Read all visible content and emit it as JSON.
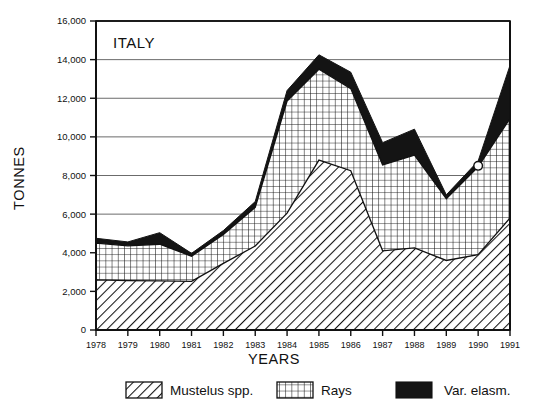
{
  "chart_data": {
    "type": "area",
    "stacked": true,
    "title": "ITALY",
    "xlabel": "YEARS",
    "ylabel": "TONNES",
    "categories": [
      1978,
      1979,
      1980,
      1981,
      1982,
      1983,
      1984,
      1985,
      1986,
      1987,
      1988,
      1989,
      1990,
      1991
    ],
    "x": [
      "1978",
      "1979",
      "1980",
      "1981",
      "1982",
      "1983",
      "1984",
      "1985",
      "1986",
      "1987",
      "1988",
      "1989",
      "1990",
      "1991"
    ],
    "xlim": [
      1978,
      1991
    ],
    "ylim": [
      0,
      16000
    ],
    "yticks": [
      0,
      2000,
      4000,
      6000,
      8000,
      10000,
      12000,
      14000,
      16000
    ],
    "ytick_labels": [
      "0",
      "2,000",
      "4,000",
      "6,000",
      "8,000",
      "10,000",
      "12,000",
      "14,000",
      "16,000"
    ],
    "grid": true,
    "grid_axis": "y",
    "legend_position": "bottom",
    "series": [
      {
        "name": "Mustelus spp.",
        "pattern": "diagonal-hatch",
        "color": "#ffffff",
        "values": [
          2600,
          2560,
          2540,
          2520,
          3450,
          4350,
          6050,
          8800,
          8250,
          4100,
          4250,
          3600,
          3900,
          5800
        ]
      },
      {
        "name": "Rays",
        "pattern": "crosshatch-grid",
        "color": "#ffffff",
        "values": [
          1900,
          1800,
          1900,
          1300,
          1500,
          2000,
          5800,
          4700,
          4250,
          4450,
          4800,
          3200,
          4550,
          5150
        ]
      },
      {
        "name": "Var. elasm.",
        "pattern": "solid",
        "color": "#141414",
        "values": [
          250,
          200,
          600,
          150,
          200,
          300,
          550,
          750,
          850,
          1150,
          1350,
          200,
          300,
          2750
        ]
      }
    ],
    "totals": [
      4750,
      4560,
      5040,
      3970,
      5150,
      6650,
      12400,
      14250,
      13350,
      9700,
      10400,
      7000,
      8750,
      13700
    ],
    "annotations": [
      {
        "name": "hole-punch-marker",
        "shape": "circle",
        "x": 1990,
        "y": 8500
      }
    ]
  },
  "legend": {
    "items": [
      {
        "label": "Mustelus spp.",
        "swatch": "diagonal-hatch"
      },
      {
        "label": "Rays",
        "swatch": "crosshatch-grid"
      },
      {
        "label": "Var. elasm.",
        "swatch": "solid-black"
      }
    ]
  },
  "colors": {
    "ink": "#111111",
    "grid": "#6b6b6b",
    "solid_band": "#141414",
    "background": "#ffffff"
  }
}
